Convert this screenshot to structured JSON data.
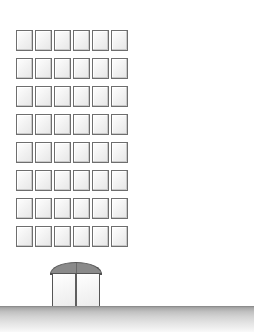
{
  "scene": {
    "title": "Tall office building sketch",
    "width": 254,
    "height": 332,
    "background_color": "#ffffff",
    "style": "pencil line drawing"
  },
  "building": {
    "name": "tower-block",
    "floors": 8,
    "windows_per_floor": 6,
    "total_windows": 48,
    "window_fill_color": "#f6f6f6",
    "window_border_color": "#6e6e6e",
    "grid": {
      "left": 16,
      "top": 30,
      "window_width": 17,
      "window_height": 21,
      "column_gap": 2,
      "row_gap": 7
    },
    "floor_labels": [
      "floor-8",
      "floor-7",
      "floor-6",
      "floor-5",
      "floor-4",
      "floor-3",
      "floor-2",
      "floor-1"
    ]
  },
  "entrance": {
    "name": "main-entrance",
    "dome": {
      "label": "arched canopy",
      "color": "#8a8a8a",
      "left": 50,
      "top": 262,
      "width": 52,
      "height": 12
    },
    "door": {
      "label": "double glass door",
      "panels": 2,
      "panel_labels": [
        "left-panel",
        "right-panel"
      ],
      "fill_color": "#fafafa",
      "border_color": "#555555",
      "left": 52,
      "top": 273,
      "width": 48,
      "height": 34
    }
  },
  "ground": {
    "name": "ground-plane",
    "line_y": 306,
    "top_color": "#9a9a9a",
    "bottom_color": "#ffffff",
    "height": 26
  }
}
